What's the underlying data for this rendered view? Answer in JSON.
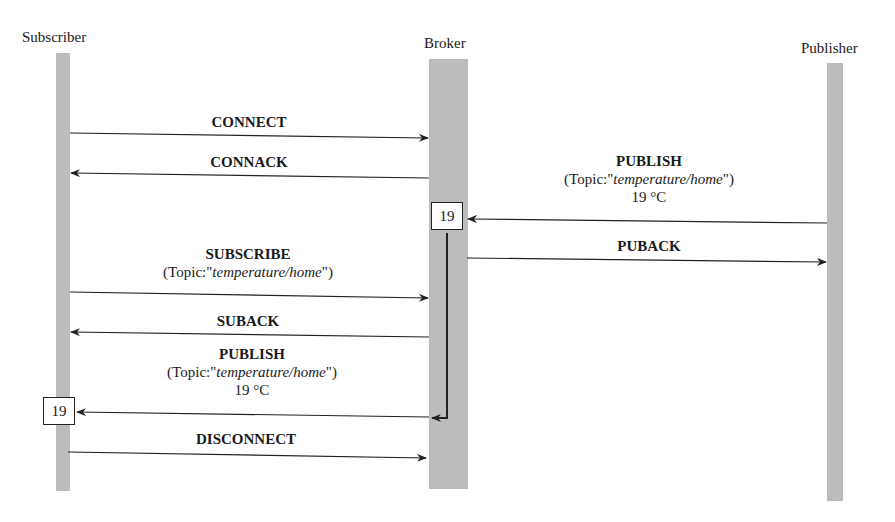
{
  "actors": {
    "subscriber": "Subscriber",
    "broker": "Broker",
    "publisher": "Publisher"
  },
  "messages": [
    {
      "id": "connect",
      "label": "CONNECT",
      "from": "subscriber",
      "to": "broker"
    },
    {
      "id": "connack",
      "label": "CONNACK",
      "from": "broker",
      "to": "subscriber"
    },
    {
      "id": "publish-in",
      "label": "PUBLISH",
      "topic_prefix": "(Topic:\"",
      "topic": "temperature/home",
      "topic_suffix": "\")",
      "value": "19 °C",
      "from": "publisher",
      "to": "broker"
    },
    {
      "id": "puback",
      "label": "PUBACK",
      "from": "broker",
      "to": "publisher"
    },
    {
      "id": "subscribe",
      "label": "SUBSCRIBE",
      "topic_prefix": "(Topic:\"",
      "topic": "temperature/home",
      "topic_suffix": "\")",
      "from": "subscriber",
      "to": "broker"
    },
    {
      "id": "suback",
      "label": "SUBACK",
      "from": "broker",
      "to": "subscriber"
    },
    {
      "id": "publish-out",
      "label": "PUBLISH",
      "topic_prefix": "(Topic:\"",
      "topic": "temperature/home",
      "topic_suffix": "\")",
      "value": "19 °C",
      "from": "broker",
      "to": "subscriber"
    },
    {
      "id": "disconnect",
      "label": "DISCONNECT",
      "from": "subscriber",
      "to": "broker"
    }
  ],
  "stored_values": {
    "broker": "19",
    "subscriber": "19"
  },
  "colors": {
    "lifeline": "#bcbcbc",
    "line": "#222222"
  }
}
